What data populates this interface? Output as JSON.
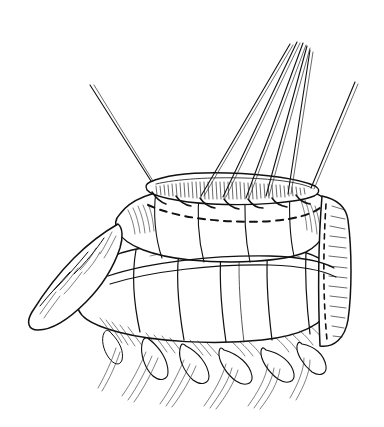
{
  "figure": {
    "panel_letter": "K",
    "domain": "medical-line-illustration",
    "medium": "pen-and-ink line drawing",
    "palette": {
      "background": "#ffffff",
      "ink": "#111111",
      "hatching": "#2a2a2a"
    },
    "canvas": {
      "width": 384,
      "height": 427
    }
  },
  "subject": {
    "title": "Colonic anastomosis with traction sutures",
    "structures": [
      {
        "name": "proximal-colon-segment",
        "label": "upper bowel limb"
      },
      {
        "name": "distal-colon-segment",
        "label": "lower bowel limb"
      },
      {
        "name": "anastomotic-suture-line",
        "label": "sutured enterotomy edge"
      },
      {
        "name": "incision-marking",
        "label": "dashed incision line"
      },
      {
        "name": "epiploic-appendages",
        "label": "appendices epiploicae"
      },
      {
        "name": "mesenteric-edge",
        "label": "mesentery"
      },
      {
        "name": "stapled-cut-end",
        "label": "stapled transected end"
      },
      {
        "name": "haustra",
        "label": "haustral sacculations"
      }
    ]
  },
  "sutures": {
    "count": 7,
    "description": "traction sutures drawn upward and tied at the anastomotic edge",
    "threads": [
      {
        "id": "suture-1",
        "anchor_x": 151,
        "anchor_y": 181,
        "tip_x": 90,
        "tip_y": 85,
        "strands": 2
      },
      {
        "id": "suture-2",
        "anchor_x": 201,
        "anchor_y": 196,
        "tip_x": 290,
        "tip_y": 44,
        "strands": 2
      },
      {
        "id": "suture-3",
        "anchor_x": 223,
        "anchor_y": 197,
        "tip_x": 297,
        "tip_y": 42,
        "strands": 2
      },
      {
        "id": "suture-4",
        "anchor_x": 246,
        "anchor_y": 198,
        "tip_x": 303,
        "tip_y": 43,
        "strands": 2
      },
      {
        "id": "suture-5",
        "anchor_x": 266,
        "anchor_y": 196,
        "tip_x": 307,
        "tip_y": 46,
        "strands": 2
      },
      {
        "id": "suture-6",
        "anchor_x": 288,
        "anchor_y": 194,
        "tip_x": 310,
        "tip_y": 50,
        "strands": 2
      },
      {
        "id": "suture-7",
        "anchor_x": 311,
        "anchor_y": 188,
        "tip_x": 355,
        "tip_y": 82,
        "strands": 2
      }
    ]
  }
}
